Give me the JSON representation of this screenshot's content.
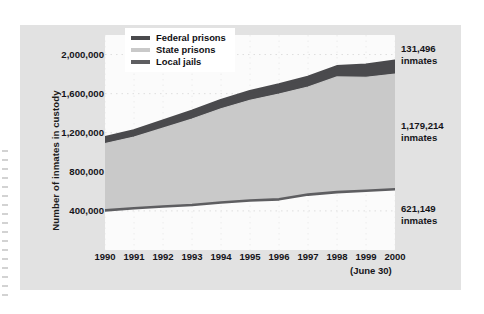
{
  "figure": {
    "y_axis_title": "Number of inmates in custody",
    "x_axis_note": "(June 30)"
  },
  "legend": {
    "items": [
      {
        "label": "Federal prisons",
        "color": "#4a4a4d",
        "name": "legend-federal-prisons"
      },
      {
        "label": "State prisons",
        "color": "#c9c9c9",
        "name": "legend-state-prisons"
      },
      {
        "label": "Local jails",
        "color": "#5e5e61",
        "name": "legend-local-jails"
      }
    ]
  },
  "callouts": [
    {
      "value": "131,496",
      "unit": "inmates",
      "name": "callout-federal-prisons"
    },
    {
      "value": "1,179,214",
      "unit": "inmates",
      "name": "callout-state-prisons"
    },
    {
      "value": "621,149",
      "unit": "inmates",
      "name": "callout-local-jails"
    }
  ],
  "chart_data": {
    "type": "area",
    "title": "",
    "xlabel": "",
    "ylabel": "Number of inmates in custody",
    "x": [
      1990,
      1991,
      1992,
      1993,
      1994,
      1995,
      1996,
      1997,
      1998,
      1999,
      2000
    ],
    "xtick_labels": [
      "1990",
      "1991",
      "1992",
      "1993",
      "1994",
      "1995",
      "1996",
      "1997",
      "1998",
      "1999",
      "2000"
    ],
    "ytick_labels": [
      "400,000",
      "800,000",
      "1,200,000",
      "1,600,000",
      "2,000,000"
    ],
    "ytick_values": [
      400000,
      800000,
      1200000,
      1600000,
      2000000
    ],
    "ylim": [
      0,
      2200000
    ],
    "xlim": [
      1990,
      2000
    ],
    "grid": "dotted",
    "legend_position": "top-left-inside",
    "stacked": true,
    "stack_order": [
      "Local jails",
      "State prisons",
      "Federal prisons"
    ],
    "series": [
      {
        "name": "Local jails",
        "color": "#5e5e61",
        "values": [
          405320,
          426479,
          444584,
          459804,
          486474,
          507044,
          518492,
          567079,
          592462,
          605943,
          621149
        ]
      },
      {
        "name": "State prisons",
        "color": "#c9c9c9",
        "values": [
          684544,
          728605,
          802241,
          880121,
          958704,
          1025624,
          1076625,
          1100850,
          1178978,
          1161490,
          1179214
        ]
      },
      {
        "name": "Federal prisons",
        "color": "#4a4a4d",
        "values": [
          58838,
          63930,
          72071,
          80815,
          85500,
          89538,
          95088,
          99175,
          104507,
          125682,
          131496
        ]
      }
    ],
    "totals": [
      1148702,
      1219014,
      1318896,
      1420740,
      1530678,
      1622206,
      1690205,
      1767104,
      1875947,
      1893115,
      1931859
    ]
  }
}
